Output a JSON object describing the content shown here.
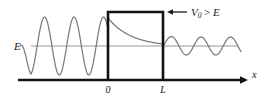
{
  "figure": {
    "background_color": "#ffffff",
    "width": 270,
    "height": 100
  },
  "axes": {
    "x_axis": {
      "label": "x",
      "label_x": 252,
      "label_y": 78,
      "color": "#111111",
      "baseline_y": 80,
      "start_x": 18,
      "end_x": 243,
      "arrow": "right-arrow"
    },
    "ticks": [
      {
        "label": "0",
        "x": 108,
        "y": 93
      },
      {
        "label": "L",
        "x": 163,
        "y": 93
      }
    ]
  },
  "energy_level": {
    "label": "E",
    "label_x": 14,
    "label_y": 50,
    "line_y": 46,
    "line_start_x": 31,
    "line_end_x": 238,
    "color": "#8a8a8a"
  },
  "barrier": {
    "left_x": 108,
    "right_x": 163,
    "top_y": 12,
    "bottom_y": 80,
    "color": "#111111",
    "stroke_width": 2.6
  },
  "annotation": {
    "text": "V0 > E",
    "text_display": "V",
    "subscript": "0",
    "relation": ">",
    "energy_symbol": "E",
    "arrow_name": "left-arrow",
    "arrow_tip_x": 168,
    "arrow_tail_x": 187,
    "arrow_y": 12,
    "text_x": 191,
    "text_y": 16,
    "color": "#1a1a1a"
  },
  "chart_data": {
    "type": "line",
    "xlabel": "x",
    "ylabel": "",
    "grid": false,
    "legend": false,
    "xlim": [
      0,
      270
    ],
    "ylim": [
      100,
      0
    ],
    "annotations": [
      "E",
      "V0 > E",
      "0",
      "L"
    ],
    "series": [
      {
        "name": "incident-wave",
        "color": "#7a7a7a",
        "region": "x < 0",
        "amplitude": 29,
        "wavelength": 29.5,
        "cycles": 3.0,
        "baseline_y": 46,
        "x_start": 20,
        "x_end": 108
      },
      {
        "name": "barrier-decay",
        "color": "#7a7a7a",
        "region": "0 < x < L",
        "type": "exponential-decay",
        "y_start": 18,
        "y_end": 44,
        "x_start": 108,
        "x_end": 163
      },
      {
        "name": "transmitted-wave",
        "color": "#7a7a7a",
        "region": "x > L",
        "amplitude": 9,
        "wavelength": 29.5,
        "cycles": 2.6,
        "baseline_y": 46,
        "x_start": 163,
        "x_end": 241
      }
    ]
  }
}
